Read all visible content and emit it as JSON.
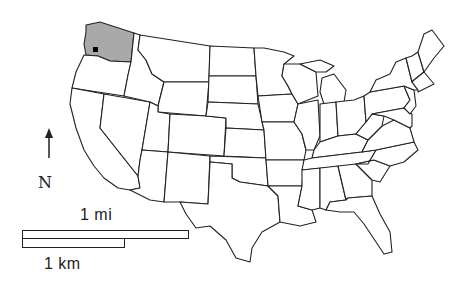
{
  "map": {
    "type": "us-states-outline",
    "highlighted_state": "Washington",
    "highlight_color": "#a9a9a9",
    "marker": {
      "shape": "square",
      "color": "#000000",
      "location": "Washington (Puget Sound area)"
    }
  },
  "north_arrow": {
    "label": "N",
    "icon": "north-arrow-icon"
  },
  "scale_bar": {
    "top_label": "1 mi",
    "bottom_label": "1 km"
  }
}
